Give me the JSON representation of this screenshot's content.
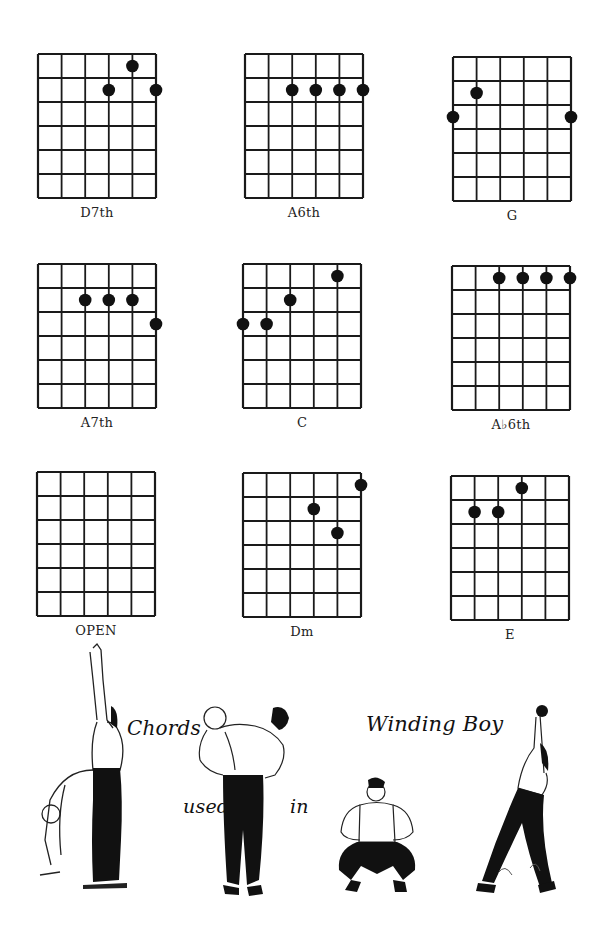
{
  "page": {
    "title_parts": [
      "Chords",
      "used",
      "in",
      "Winding Boy"
    ],
    "song": "Winding Boy"
  },
  "diagram_grid": {
    "strings": 6,
    "fret_rows": 6,
    "line_color": "#1a1a1a",
    "dot_color": "#111111"
  },
  "chords": [
    {
      "name": "D7th",
      "dots": [
        [
          4,
          0
        ],
        [
          3,
          1
        ],
        [
          5,
          1
        ]
      ]
    },
    {
      "name": "A6th",
      "dots": [
        [
          2,
          1
        ],
        [
          3,
          1
        ],
        [
          4,
          1
        ],
        [
          5,
          1
        ]
      ]
    },
    {
      "name": "G",
      "dots": [
        [
          1,
          1
        ],
        [
          0,
          2
        ],
        [
          5,
          2
        ]
      ]
    },
    {
      "name": "A7th",
      "dots": [
        [
          2,
          1
        ],
        [
          3,
          1
        ],
        [
          4,
          1
        ],
        [
          5,
          2
        ]
      ]
    },
    {
      "name": "C",
      "dots": [
        [
          4,
          0
        ],
        [
          2,
          1
        ],
        [
          0,
          2
        ],
        [
          1,
          2
        ]
      ]
    },
    {
      "name": "A♭6th",
      "dots": [
        [
          2,
          0
        ],
        [
          3,
          0
        ],
        [
          4,
          0
        ],
        [
          5,
          0
        ]
      ]
    },
    {
      "name": "OPEN",
      "dots": []
    },
    {
      "name": "Dm",
      "dots": [
        [
          5,
          0
        ],
        [
          3,
          1
        ],
        [
          4,
          2
        ]
      ]
    },
    {
      "name": "E",
      "dots": [
        [
          3,
          0
        ],
        [
          1,
          1
        ],
        [
          2,
          1
        ]
      ]
    }
  ],
  "caption": {
    "word1": "Chords",
    "word2": "used",
    "word3": "in",
    "word4": "Winding Boy"
  },
  "illustrations": [
    "figure-stretching-arms-up-and-bending",
    "figure-lifting-another-man",
    "figure-squatting",
    "figure-lunging-with-arm-raised"
  ]
}
